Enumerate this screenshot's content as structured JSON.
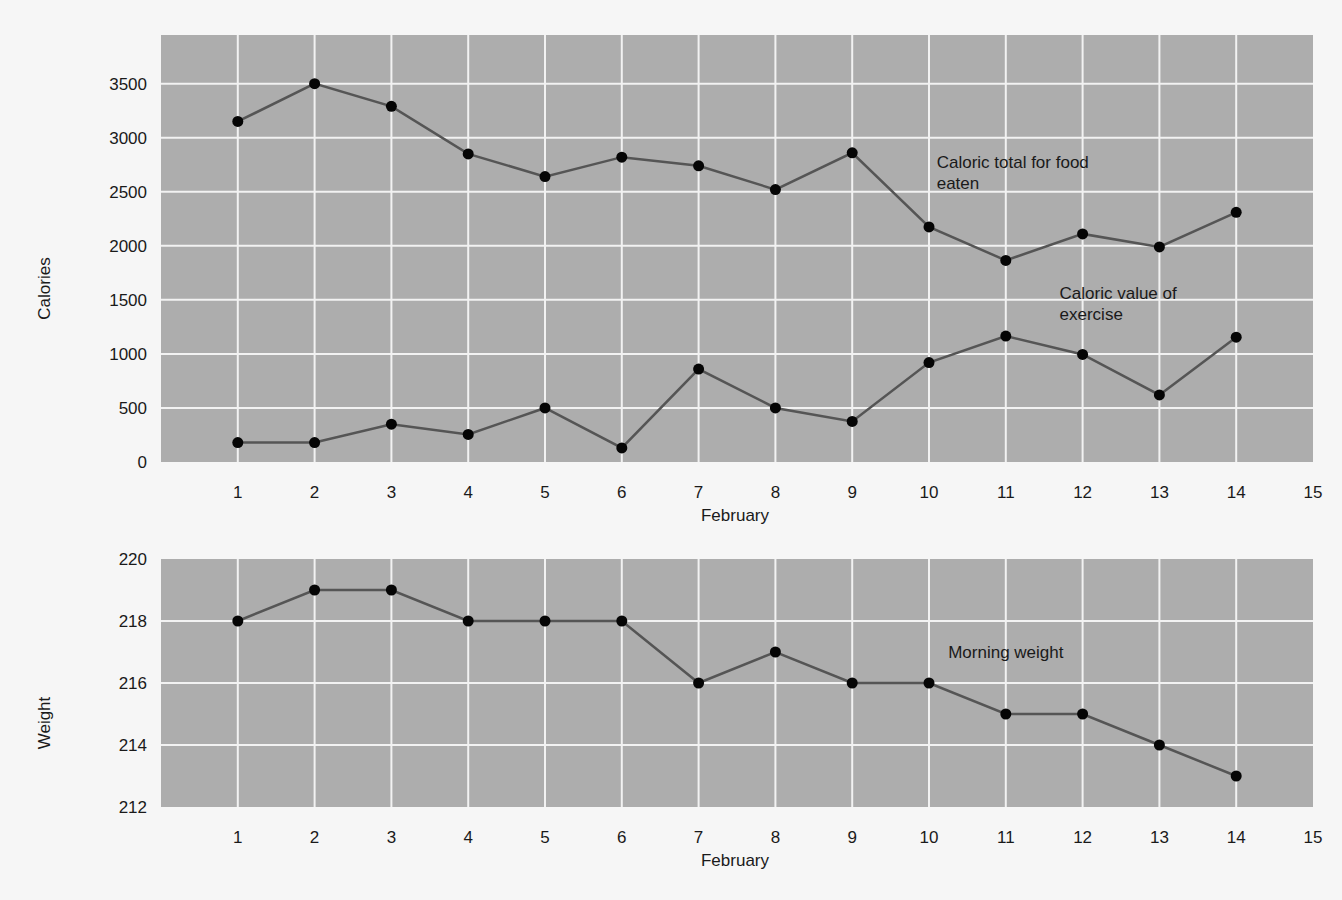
{
  "chart_data": [
    {
      "type": "line",
      "title": "",
      "xlabel": "February",
      "ylabel": "Calories",
      "x": [
        1,
        2,
        3,
        4,
        5,
        6,
        7,
        8,
        9,
        10,
        11,
        12,
        13,
        14
      ],
      "x_ticks": [
        "1",
        "2",
        "3",
        "4",
        "5",
        "6",
        "7",
        "8",
        "9",
        "10",
        "11",
        "12",
        "13",
        "14",
        "15"
      ],
      "y_ticks": [
        "0",
        "500",
        "1000",
        "1500",
        "2000",
        "2500",
        "3000",
        "3500"
      ],
      "xlim": [
        0,
        15
      ],
      "ylim": [
        0,
        3950
      ],
      "grid": true,
      "legend": "none (inline annotations)",
      "series": [
        {
          "name": "Caloric total for food eaten",
          "values": [
            3150,
            3500,
            3290,
            2850,
            2640,
            2820,
            2740,
            2520,
            2860,
            2175,
            1865,
            2110,
            1990,
            2310
          ]
        },
        {
          "name": "Caloric value of exercise",
          "values": [
            180,
            180,
            350,
            255,
            500,
            130,
            860,
            500,
            375,
            920,
            1165,
            995,
            620,
            1155
          ]
        }
      ],
      "annotations": [
        {
          "text_line1": "Caloric total for food",
          "text_line2": "eaten",
          "x": 10.1,
          "y": 2720
        },
        {
          "text_line1": "Caloric value of",
          "text_line2": "exercise",
          "x": 11.7,
          "y": 1510
        }
      ]
    },
    {
      "type": "line",
      "title": "",
      "xlabel": "February",
      "ylabel": "Weight",
      "x": [
        1,
        2,
        3,
        4,
        5,
        6,
        7,
        8,
        9,
        10,
        11,
        12,
        13,
        14
      ],
      "x_ticks": [
        "1",
        "2",
        "3",
        "4",
        "5",
        "6",
        "7",
        "8",
        "9",
        "10",
        "11",
        "12",
        "13",
        "14",
        "15"
      ],
      "y_ticks": [
        "212",
        "214",
        "216",
        "218",
        "220"
      ],
      "xlim": [
        0,
        15
      ],
      "ylim": [
        212,
        220
      ],
      "grid": true,
      "legend": "none (inline annotation)",
      "series": [
        {
          "name": "Morning weight",
          "values": [
            218,
            219,
            219,
            218,
            218,
            218,
            216,
            217,
            216,
            216,
            215,
            215,
            214,
            213
          ]
        }
      ],
      "annotations": [
        {
          "text_line1": "Morning weight",
          "text_line2": "",
          "x": 10.25,
          "y": 216.8
        }
      ]
    }
  ],
  "layout": {
    "panels": [
      {
        "left": 161,
        "top": 35,
        "right": 1313,
        "bottom": 462
      },
      {
        "left": 161,
        "top": 559,
        "right": 1313,
        "bottom": 807
      }
    ],
    "colors": {
      "page_bg": "#f6f6f6",
      "plot_bg": "#adadad",
      "grid": "#f2f2f2",
      "line": "#555555",
      "marker": "#050505"
    }
  }
}
